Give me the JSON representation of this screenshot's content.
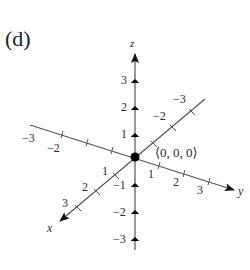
{
  "panel_label": "(d)",
  "axes": {
    "x": {
      "label": "x",
      "ticks": [
        "1",
        "2",
        "3"
      ],
      "neg_ticks": [
        "-1",
        "-2",
        "-3"
      ]
    },
    "y": {
      "label": "y",
      "ticks": [
        "1",
        "2",
        "3"
      ],
      "neg_ticks": [
        "-1",
        "-2",
        "-3"
      ]
    },
    "z": {
      "label": "z",
      "ticks": [
        "1",
        "2",
        "3"
      ],
      "neg_ticks": [
        "-1",
        "-2",
        "-3"
      ]
    }
  },
  "origin_label": "⟨0, 0, 0⟩",
  "labels": {
    "z_3": "3",
    "z_2": "2",
    "z_1": "1",
    "z_n1": "−1",
    "z_n2": "−2",
    "z_n3": "−3",
    "y_1": "1",
    "y_2": "2",
    "y_3": "3",
    "y_n2": "−2",
    "y_n3": "−3",
    "x_1": "1",
    "x_2": "2",
    "x_3": "3",
    "x_n2": "−2",
    "x_n3": "−3"
  },
  "colors": {
    "axis": "#555555",
    "origin_point": "#000000",
    "text": "#2a2a2a"
  }
}
